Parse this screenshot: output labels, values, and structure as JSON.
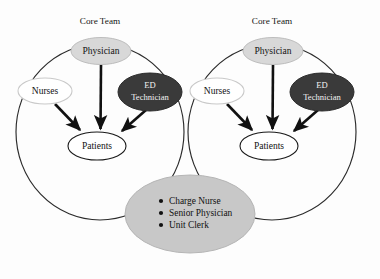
{
  "diagram": {
    "title_left": "Core Team",
    "title_right": "Core Team",
    "colors": {
      "background": "#fdfdfd",
      "physician_fill": "#d8d8d8",
      "physician_stroke": "#bdbdbd",
      "nurses_fill": "#ffffff",
      "nurses_stroke": "#c9c9c9",
      "ed_tech_fill": "#3a3a3a",
      "ed_tech_stroke": "#2a2a2a",
      "patients_fill": "#ffffff",
      "patients_stroke": "#1a1a1a",
      "support_fill": "#c8c8c8",
      "support_stroke": "#b5b5b5",
      "big_circle_stroke": "#2b2b2b",
      "arrow_color": "#111111",
      "text_dark": "#111111",
      "text_light": "#f2f2f2"
    },
    "clusters": [
      {
        "id": "left-core-team",
        "title": "Core Team",
        "nodes": {
          "physician": "Physician",
          "nurses": "Nurses",
          "ed_technician_line1": "ED",
          "ed_technician_line2": "Technician",
          "patients": "Patients"
        }
      },
      {
        "id": "right-core-team",
        "title": "Core Team",
        "nodes": {
          "physician": "Physician",
          "nurses": "Nurses",
          "ed_technician_line1": "ED",
          "ed_technician_line2": "Technician",
          "patients": "Patients"
        }
      }
    ],
    "support_group": {
      "bullets": [
        "Charge Nurse",
        "Senior Physician",
        "Unit Clerk"
      ]
    }
  }
}
